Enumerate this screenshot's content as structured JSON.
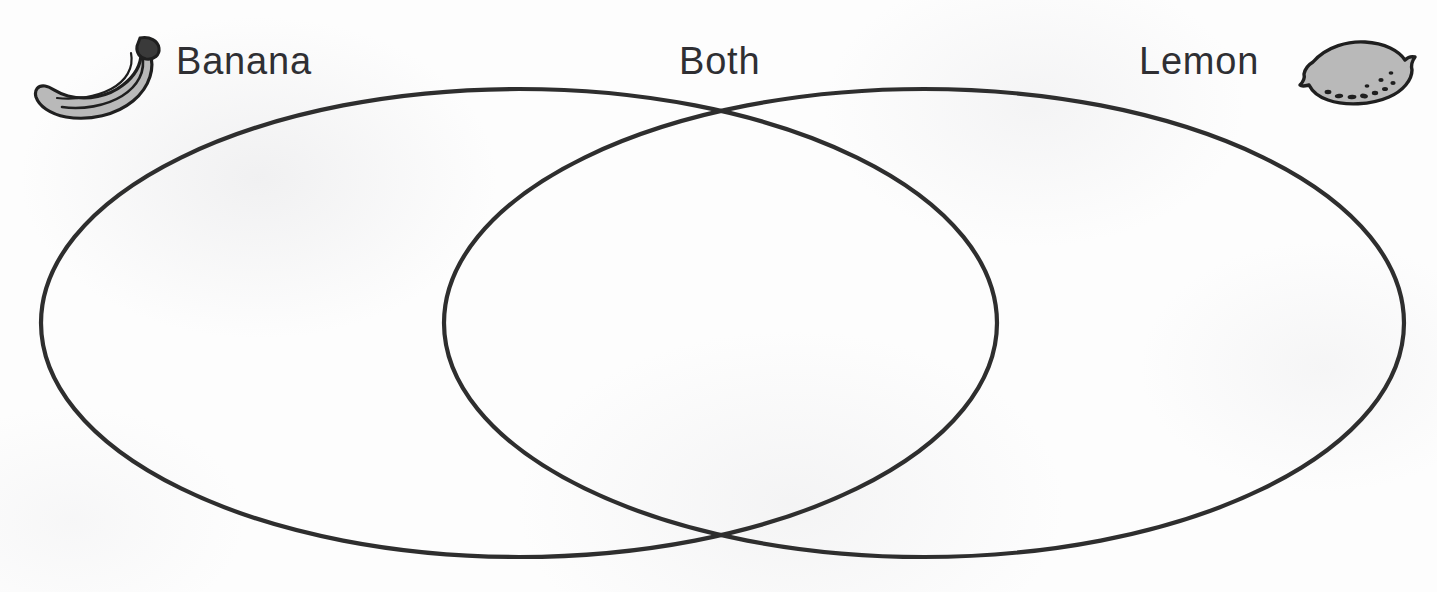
{
  "worksheet": {
    "type": "venn-diagram",
    "title": "Banana and Lemon Venn Diagram",
    "background_color": "#fdfdfd",
    "stroke_color": "#2e2e2e",
    "text_color": "#2f2f33",
    "icon_fill_color": "#b9b9b9",
    "icon_outline_color": "#1f1f1f"
  },
  "labels": {
    "left": "Banana",
    "center": "Both",
    "right": "Lemon"
  },
  "icons": {
    "left": "banana-icon",
    "right": "lemon-icon"
  },
  "chart_data": {
    "type": "venn",
    "sets": [
      {
        "name": "Banana",
        "label_position": "top-left",
        "center_x": 519,
        "center_y": 323,
        "radius_x": 478,
        "radius_y": 234
      },
      {
        "name": "Lemon",
        "label_position": "top-right",
        "center_x": 924,
        "center_y": 323,
        "radius_x": 480,
        "radius_y": 234
      }
    ],
    "intersection_label": "Both",
    "intersection_top": {
      "x": 718,
      "y": 112
    },
    "intersection_bottom": {
      "x": 718,
      "y": 532
    },
    "entries": [],
    "title": "",
    "legend": "none",
    "grid": false
  }
}
